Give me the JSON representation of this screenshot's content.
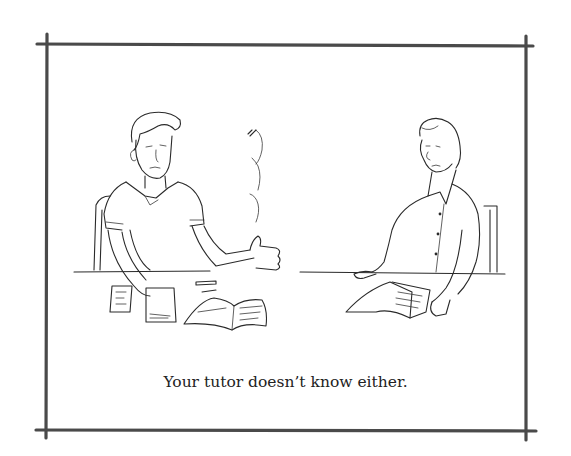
{
  "cartoon": {
    "caption": "Your tutor doesn’t know either.",
    "frame_color": "#4a4a4a",
    "ink_color": "#2a2a2a",
    "background_color": "#ffffff"
  }
}
